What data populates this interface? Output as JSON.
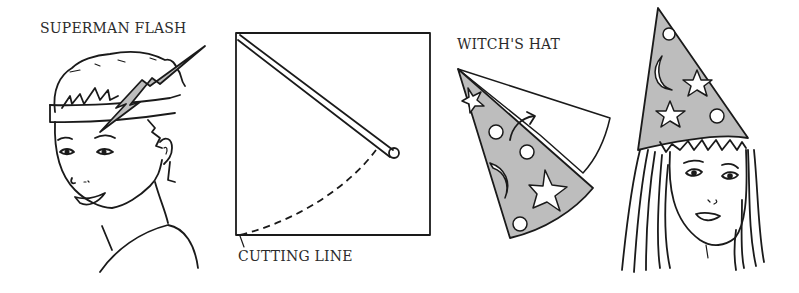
{
  "labels": {
    "superman_flash": "SUPERMAN FLASH",
    "cutting_line": "CUTTING LINE",
    "witchs_hat": "WITCH'S HAT"
  },
  "figures": [
    {
      "id": "boy-with-lightning-headband",
      "caption": "SUPERMAN FLASH"
    },
    {
      "id": "square-paper-with-string-compass",
      "caption": "CUTTING LINE"
    },
    {
      "id": "cone-hat-rolling-diagram",
      "caption": "WITCH'S HAT"
    },
    {
      "id": "girl-wearing-witch-hat",
      "caption": ""
    }
  ],
  "colors": {
    "ink": "#1a1a1a",
    "hat_fill": "#bdbdbd",
    "background": "#ffffff"
  }
}
